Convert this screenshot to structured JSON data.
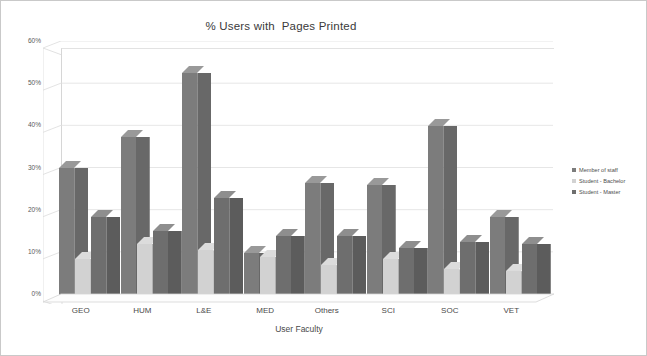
{
  "chart": {
    "title": "% Users with  Pages Printed",
    "xlabel": "User Faculty",
    "ylabel": ""
  },
  "legend": {
    "position": "right",
    "items": [
      {
        "label": "Member of staff",
        "color": "#7c7c7c"
      },
      {
        "label": "Student - Bachelor",
        "color": "#d2d2d2"
      },
      {
        "label": "Student - Master",
        "color": "#6e6e6e"
      }
    ]
  },
  "yaxis": {
    "ticks": [
      "60%",
      "50%",
      "40%",
      "30%",
      "20%",
      "10%",
      "0%"
    ]
  },
  "xaxis": {
    "categories": [
      "GEO",
      "HUM",
      "L&E",
      "MED",
      "Others",
      "SCI",
      "SOC",
      "VET"
    ]
  },
  "chart_data": {
    "type": "bar",
    "title": "% Users with  Pages Printed",
    "xlabel": "User Faculty",
    "ylabel": "",
    "ylim": [
      0,
      60
    ],
    "ytick_values": [
      0,
      10,
      20,
      30,
      40,
      50,
      60
    ],
    "ytick_labels": [
      "0%",
      "10%",
      "20%",
      "30%",
      "40%",
      "50%",
      "60%"
    ],
    "grid": true,
    "legend_position": "right",
    "categories": [
      "GEO",
      "HUM",
      "L&E",
      "MED",
      "Others",
      "SCI",
      "SOC",
      "VET"
    ],
    "series": [
      {
        "name": "Member of staff",
        "color": "#7c7c7c",
        "values": [
          31.5,
          39.0,
          54.0,
          11.5,
          28.0,
          27.5,
          41.5,
          20.0
        ]
      },
      {
        "name": "Student - Bachelor",
        "color": "#d2d2d2",
        "values": [
          10.0,
          13.5,
          12.0,
          10.5,
          8.5,
          10.0,
          7.5,
          7.0
        ]
      },
      {
        "name": "Student - Master",
        "color": "#6e6e6e",
        "values": [
          20.0,
          16.5,
          24.5,
          15.5,
          15.5,
          12.5,
          14.0,
          13.5
        ]
      }
    ]
  }
}
